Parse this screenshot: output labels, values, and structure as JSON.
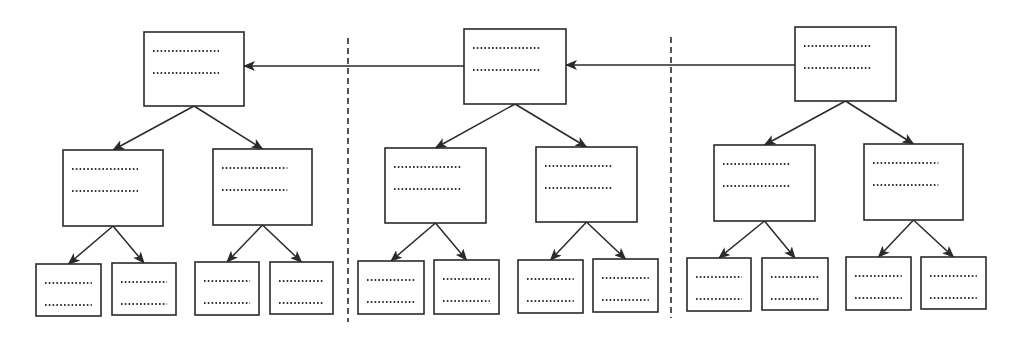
{
  "diagram": {
    "title": "",
    "colors": {
      "stroke": "#2a2a2a",
      "background": "#ffffff"
    },
    "separators": [
      {
        "x": 348,
        "y1": 38,
        "y2": 322
      },
      {
        "x": 671,
        "y1": 37,
        "y2": 318
      }
    ],
    "links": [
      {
        "from": "group-2-root",
        "to": "group-1-root",
        "y": 66,
        "x1": 464,
        "x2": 244
      },
      {
        "from": "group-3-root",
        "to": "group-2-root",
        "y": 65,
        "x1": 795,
        "x2": 566
      }
    ],
    "groups": [
      {
        "name": "group-1",
        "root": {
          "x": 144,
          "y": 32,
          "w": 100,
          "h": 74,
          "lines": 2
        },
        "children": [
          {
            "x": 63,
            "y": 150,
            "w": 100,
            "h": 76,
            "lines": 2,
            "leaves": [
              {
                "x": 36,
                "y": 264,
                "w": 65,
                "h": 52
              },
              {
                "x": 112,
                "y": 263,
                "w": 64,
                "h": 52
              }
            ]
          },
          {
            "x": 213,
            "y": 149,
            "w": 99,
            "h": 76,
            "lines": 2,
            "leaves": [
              {
                "x": 195,
                "y": 262,
                "w": 64,
                "h": 53
              },
              {
                "x": 270,
                "y": 262,
                "w": 63,
                "h": 52
              }
            ]
          }
        ]
      },
      {
        "name": "group-2",
        "root": {
          "x": 464,
          "y": 29,
          "w": 102,
          "h": 75,
          "lines": 2
        },
        "children": [
          {
            "x": 385,
            "y": 148,
            "w": 101,
            "h": 75,
            "lines": 2,
            "leaves": [
              {
                "x": 358,
                "y": 261,
                "w": 66,
                "h": 53
              },
              {
                "x": 434,
                "y": 260,
                "w": 65,
                "h": 54
              }
            ]
          },
          {
            "x": 536,
            "y": 147,
            "w": 101,
            "h": 75,
            "lines": 2,
            "leaves": [
              {
                "x": 518,
                "y": 260,
                "w": 65,
                "h": 53
              },
              {
                "x": 593,
                "y": 259,
                "w": 65,
                "h": 53
              }
            ]
          }
        ]
      },
      {
        "name": "group-3",
        "root": {
          "x": 795,
          "y": 27,
          "w": 101,
          "h": 74,
          "lines": 2
        },
        "children": [
          {
            "x": 714,
            "y": 145,
            "w": 101,
            "h": 76,
            "lines": 2,
            "leaves": [
              {
                "x": 687,
                "y": 258,
                "w": 64,
                "h": 53
              },
              {
                "x": 762,
                "y": 258,
                "w": 66,
                "h": 52
              }
            ]
          },
          {
            "x": 864,
            "y": 144,
            "w": 99,
            "h": 76,
            "lines": 2,
            "leaves": [
              {
                "x": 846,
                "y": 257,
                "w": 65,
                "h": 53
              },
              {
                "x": 921,
                "y": 257,
                "w": 65,
                "h": 52
              }
            ]
          }
        ]
      }
    ]
  }
}
